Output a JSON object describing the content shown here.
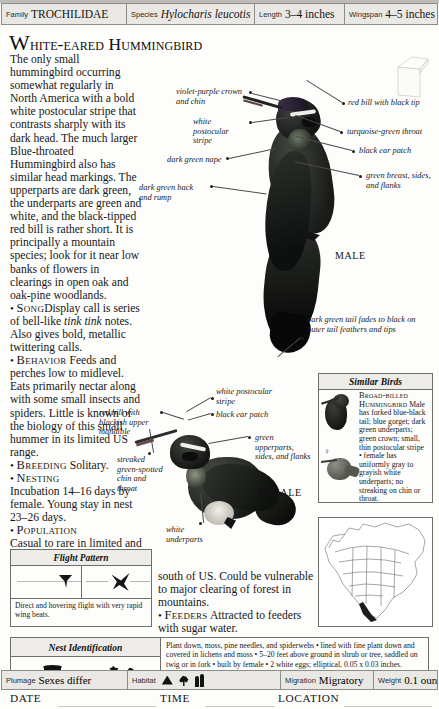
{
  "header": {
    "fields": [
      {
        "label": "Family",
        "value": "TROCHILIDAE",
        "italic": false
      },
      {
        "label": "Species",
        "value": "Hylocharis leucotis",
        "italic": true
      },
      {
        "label": "Length",
        "value": "3–4 inches",
        "italic": false
      },
      {
        "label": "Wingspan",
        "value": "4–5 inches",
        "italic": false
      }
    ]
  },
  "title": "White-eared Hummingbird",
  "description": "The only small hummingbird occurring somewhat regularly in North America with a bold white postocular stripe that contrasts sharply with its dark head. The much larger Blue-throated Hummingbird also has similar head markings. The upperparts are dark green, the underparts are green and white, and the black-tipped red bill is rather short. It is principally a mountain species; look for it near low banks of flowers in clearings in open oak and oak-pine woodlands.",
  "sections": [
    {
      "heading": "Song",
      "text": "Display call is series of bell-like ",
      "italic": "tink tink",
      "text2": " notes. Also gives bold, metallic twittering calls."
    },
    {
      "heading": "Behavior",
      "text": "Feeds and perches low to midlevel. Eats primarily nectar along with some small insects and spiders. Little is known of the biology of this small hummer in its limited US range.",
      "italic": "",
      "text2": ""
    },
    {
      "heading": "Breeding",
      "text": "Solitary.",
      "italic": "",
      "text2": ""
    },
    {
      "heading": "Nesting",
      "text": "Incubation 14–16 days by female. Young stay in nest 23–26 days.",
      "italic": "",
      "text2": ""
    },
    {
      "heading": "Population",
      "text": "Casual to rare in limited and local US range. Widespread and locally very common",
      "italic": "",
      "text2": ""
    }
  ],
  "population_continued": "south of US. Could be vulnerable to major clearing of forest in mountains.",
  "feeders": {
    "heading": "Feeders",
    "text": "Attracted to feeders with sugar water."
  },
  "callouts": {
    "male_left": [
      "violet-purple crown and chin",
      "white postocular stripe",
      "dark green nape",
      "dark green back and rump"
    ],
    "male_right": [
      "red bill with black tip",
      "turquoise-green throat",
      "black ear patch",
      "green breast, sides, and flanks"
    ],
    "male_tail": "dark green tail fades to black on outer tail feathers and tips",
    "female": [
      "red bill with blackish upper mandible",
      "streaked green-spotted chin and throat",
      "white postocular stripe",
      "black ear patch",
      "green upperparts, sides, and flanks",
      "white underparts"
    ]
  },
  "labels": {
    "male": "MALE",
    "female": "FEMALE"
  },
  "similar_birds": {
    "heading": "Similar Birds",
    "entries": [
      {
        "name": "Broad-billed Hummingbird",
        "text": "Male has forked blue-black tail; blue gorget; dark green underparts; green crown; small, thin postocular stripe"
      },
      {
        "name": "",
        "text": "• female has uniformly gray to grayish white underparts; no streaking on chin or throat."
      }
    ]
  },
  "flight_pattern": {
    "heading": "Flight Pattern",
    "text": "Direct and hovering flight with very rapid wing beats."
  },
  "nest_identification": {
    "heading": "Nest Identification",
    "shape_label": "Shape",
    "location_label": "Location",
    "text": "Plant down, moss, pine needles, and spiderwebs • lined with fine plant down and covered in lichens and moss • 5–20 feet above ground in shrub or tree, saddled on twig or in fork • built by female • 2 white eggs; elliptical, 0.05 x 0.03 inches."
  },
  "bottom": {
    "fields": [
      {
        "label": "Plumage",
        "value": "Sexes differ"
      },
      {
        "label": "Habitat",
        "value": ""
      },
      {
        "label": "Migration",
        "value": "Migratory"
      },
      {
        "label": "Weight",
        "value": "0.1 ounce"
      }
    ],
    "record": [
      {
        "label": "DATE"
      },
      {
        "label": "TIME"
      },
      {
        "label": "LOCATION"
      }
    ]
  },
  "colors": {
    "rule": "#8d8c88",
    "fill": "#e9e8e4",
    "ink": "#141414"
  }
}
